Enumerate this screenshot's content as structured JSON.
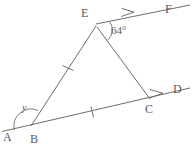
{
  "figure": {
    "background_color": "#ffffff",
    "stroke_color": "#6e6e6e",
    "text_color": "#5a5a5a",
    "points": {
      "A": {
        "label": "A",
        "x": 8,
        "y": 136,
        "node_x": 2,
        "node_y": 131
      },
      "B": {
        "label": "B",
        "x": 34,
        "y": 140,
        "node_x": 31,
        "node_y": 126
      },
      "C": {
        "label": "C",
        "x": 148,
        "y": 110,
        "node_x": 150,
        "node_y": 99
      },
      "D": {
        "label": "D",
        "x": 175,
        "y": 93,
        "node_x": 190,
        "node_y": 88
      },
      "E": {
        "label": "E",
        "x": 84,
        "y": 16,
        "node_x": 96,
        "node_y": 26
      },
      "F": {
        "label": "F",
        "x": 167,
        "y": 13,
        "node_x": 190,
        "node_y": 5
      }
    },
    "angles": [
      {
        "name": "angle-at-e",
        "label": "64°",
        "value": "64",
        "unit": "degrees",
        "vertex": "E",
        "x": 112,
        "y": 33
      },
      {
        "name": "angle-at-b",
        "label": "y",
        "value": "y",
        "unit": "unknown",
        "vertex": "B",
        "x": 22,
        "y": 110
      }
    ],
    "segments": [
      {
        "name": "segment-ab-to-d",
        "from": "A",
        "to": "D",
        "tick_marks": 0
      },
      {
        "name": "segment-be",
        "from": "B",
        "to": "E",
        "tick_marks": 1
      },
      {
        "name": "segment-ec",
        "from": "E",
        "to": "C",
        "tick_marks": 0
      },
      {
        "name": "segment-bc",
        "from": "B",
        "to": "C",
        "tick_marks": 1
      },
      {
        "name": "segment-e-to-f",
        "from": "E",
        "to": "F",
        "tick_marks": 0
      }
    ],
    "arrow_markers": [
      {
        "name": "arrow-marker-ef",
        "on_segment": "segment-e-to-f",
        "x": 131,
        "y": 13
      },
      {
        "name": "arrow-marker-cd",
        "on_segment": "segment-ab-to-d",
        "x": 160,
        "y": 94
      }
    ],
    "tick_marks": [
      {
        "name": "tick-mark-be",
        "on_segment": "segment-be",
        "x": 68,
        "y": 68
      },
      {
        "name": "tick-mark-bc",
        "on_segment": "segment-bc",
        "x": 92,
        "y": 112
      }
    ]
  }
}
